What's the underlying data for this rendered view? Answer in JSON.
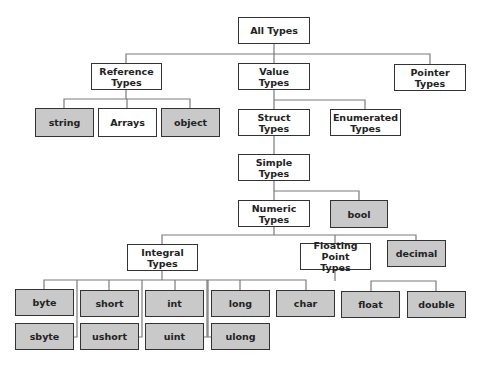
{
  "diagram": {
    "colors": {
      "category_fill": "#ffffff",
      "type_fill": "#c9c9c9",
      "border": "#333333",
      "connector": "#7a7a7a"
    },
    "nodes": [
      {
        "id": "all",
        "label": "All Types",
        "x": 238,
        "y": 17,
        "w": 72,
        "h": 27,
        "kind": "category"
      },
      {
        "id": "ref",
        "label": "Reference\nTypes",
        "x": 91,
        "y": 63,
        "w": 71,
        "h": 27,
        "kind": "category"
      },
      {
        "id": "val",
        "label": "Value\nTypes",
        "x": 238,
        "y": 63,
        "w": 72,
        "h": 27,
        "kind": "category"
      },
      {
        "id": "ptr",
        "label": "Pointer\nTypes",
        "x": 394,
        "y": 64,
        "w": 72,
        "h": 27,
        "kind": "category"
      },
      {
        "id": "string",
        "label": "string",
        "x": 35,
        "y": 108,
        "w": 59,
        "h": 29,
        "kind": "type"
      },
      {
        "id": "arrays",
        "label": "Arrays",
        "x": 98,
        "y": 108,
        "w": 59,
        "h": 29,
        "kind": "category"
      },
      {
        "id": "object",
        "label": "object",
        "x": 161,
        "y": 108,
        "w": 59,
        "h": 29,
        "kind": "type"
      },
      {
        "id": "struct",
        "label": "Struct\nTypes",
        "x": 238,
        "y": 109,
        "w": 72,
        "h": 27,
        "kind": "category"
      },
      {
        "id": "enum",
        "label": "Enumerated\nTypes",
        "x": 330,
        "y": 109,
        "w": 71,
        "h": 27,
        "kind": "category"
      },
      {
        "id": "simple",
        "label": "Simple\nTypes",
        "x": 238,
        "y": 154,
        "w": 72,
        "h": 27,
        "kind": "category"
      },
      {
        "id": "numeric",
        "label": "Numeric\nTypes",
        "x": 238,
        "y": 200,
        "w": 72,
        "h": 27,
        "kind": "category"
      },
      {
        "id": "bool",
        "label": "bool",
        "x": 330,
        "y": 200,
        "w": 58,
        "h": 28,
        "kind": "type"
      },
      {
        "id": "integral",
        "label": "Integral\nTypes",
        "x": 127,
        "y": 244,
        "w": 71,
        "h": 27,
        "kind": "category"
      },
      {
        "id": "float_pt",
        "label": "Floating Point\nTypes",
        "x": 300,
        "y": 243,
        "w": 71,
        "h": 27,
        "kind": "category"
      },
      {
        "id": "decimal",
        "label": "decimal",
        "x": 387,
        "y": 240,
        "w": 59,
        "h": 27,
        "kind": "type"
      },
      {
        "id": "byte",
        "label": "byte",
        "x": 15,
        "y": 289,
        "w": 59,
        "h": 27,
        "kind": "type"
      },
      {
        "id": "short",
        "label": "short",
        "x": 80,
        "y": 290,
        "w": 59,
        "h": 27,
        "kind": "type"
      },
      {
        "id": "int",
        "label": "int",
        "x": 145,
        "y": 290,
        "w": 59,
        "h": 27,
        "kind": "type"
      },
      {
        "id": "long",
        "label": "long",
        "x": 211,
        "y": 290,
        "w": 59,
        "h": 27,
        "kind": "type"
      },
      {
        "id": "char",
        "label": "char",
        "x": 276,
        "y": 290,
        "w": 59,
        "h": 27,
        "kind": "type"
      },
      {
        "id": "float",
        "label": "float",
        "x": 341,
        "y": 291,
        "w": 59,
        "h": 27,
        "kind": "type"
      },
      {
        "id": "double",
        "label": "double",
        "x": 407,
        "y": 291,
        "w": 59,
        "h": 27,
        "kind": "type"
      },
      {
        "id": "sbyte",
        "label": "sbyte",
        "x": 15,
        "y": 323,
        "w": 59,
        "h": 27,
        "kind": "type"
      },
      {
        "id": "ushort",
        "label": "ushort",
        "x": 80,
        "y": 323,
        "w": 59,
        "h": 27,
        "kind": "type"
      },
      {
        "id": "uint",
        "label": "uint",
        "x": 145,
        "y": 323,
        "w": 59,
        "h": 27,
        "kind": "type"
      },
      {
        "id": "ulong",
        "label": "ulong",
        "x": 211,
        "y": 323,
        "w": 59,
        "h": 27,
        "kind": "type"
      }
    ],
    "edges": [
      [
        "all",
        "ref"
      ],
      [
        "all",
        "val"
      ],
      [
        "all",
        "ptr"
      ],
      [
        "ref",
        "string"
      ],
      [
        "ref",
        "arrays"
      ],
      [
        "ref",
        "object"
      ],
      [
        "val",
        "struct"
      ],
      [
        "val",
        "enum"
      ],
      [
        "struct",
        "simple"
      ],
      [
        "simple",
        "numeric"
      ],
      [
        "simple",
        "bool"
      ],
      [
        "numeric",
        "integral"
      ],
      [
        "numeric",
        "float_pt"
      ],
      [
        "numeric",
        "decimal"
      ],
      [
        "integral",
        "byte"
      ],
      [
        "integral",
        "short"
      ],
      [
        "integral",
        "int"
      ],
      [
        "integral",
        "long"
      ],
      [
        "integral",
        "char"
      ],
      [
        "integral",
        "sbyte"
      ],
      [
        "integral",
        "ushort"
      ],
      [
        "integral",
        "uint"
      ],
      [
        "integral",
        "ulong"
      ],
      [
        "float_pt",
        "float"
      ],
      [
        "float_pt",
        "double"
      ]
    ]
  }
}
